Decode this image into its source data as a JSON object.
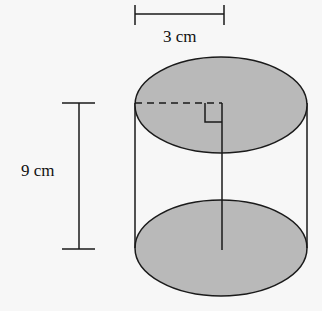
{
  "diagram": {
    "shape": "cylinder",
    "radius_label": "3 cm",
    "height_label": "9 cm",
    "fill_color": "#b9b9b9",
    "stroke_color": "#1a1a1a",
    "elements": [
      {
        "name": "radius-dimension",
        "label": "3 cm"
      },
      {
        "name": "height-dimension",
        "label": "9 cm"
      },
      {
        "name": "radius-dashed-line"
      },
      {
        "name": "right-angle-marker"
      },
      {
        "name": "axis-line"
      }
    ]
  }
}
